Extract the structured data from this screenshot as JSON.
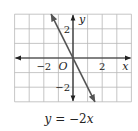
{
  "chart_data": {
    "type": "line",
    "title": "",
    "caption": "y = −2x",
    "caption_parts": {
      "y": "y",
      "eq": " = −2",
      "x": "x"
    },
    "xlabel": "x",
    "ylabel": "y",
    "origin_label": "O",
    "xlim": [
      -4,
      4
    ],
    "ylim": [
      -3,
      3
    ],
    "grid": true,
    "x_ticks": [
      {
        "value": -2,
        "label": "−2"
      },
      {
        "value": 2,
        "label": "2"
      }
    ],
    "y_ticks": [
      {
        "value": 2,
        "label": "2"
      },
      {
        "value": -2,
        "label": "−2"
      }
    ],
    "series": [
      {
        "name": "y = -2x",
        "slope": -2,
        "intercept": 0,
        "x": [
          -1.5,
          1.5
        ],
        "y": [
          3,
          -3
        ]
      }
    ],
    "colors": {
      "grid": "#b8b8b8",
      "axis": "#222222",
      "line": "#555555"
    }
  }
}
